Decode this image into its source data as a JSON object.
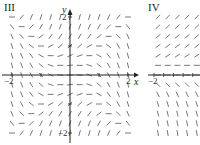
{
  "panels": [
    {
      "id": "III",
      "label": "III",
      "equation_form": "dy/dx = y^2 - x^2",
      "x_range": [
        -2.3,
        2.3
      ],
      "y_range": [
        -2.3,
        2.3
      ],
      "x_ticks": {
        "neg": "−2",
        "pos": "2"
      },
      "y_ticks": {
        "neg": "−2",
        "pos": "2"
      },
      "x_axis_label": "x",
      "y_axis_label": "y",
      "grid_step": 0.3333
    },
    {
      "id": "IV",
      "label": "IV",
      "equation_form": "dy/dx depends on y only (positive above, negative below)",
      "x_tick_visible": "−2"
    }
  ],
  "colors": {
    "segment": "#555555",
    "axis": "#222222",
    "background": "#ffffff"
  }
}
